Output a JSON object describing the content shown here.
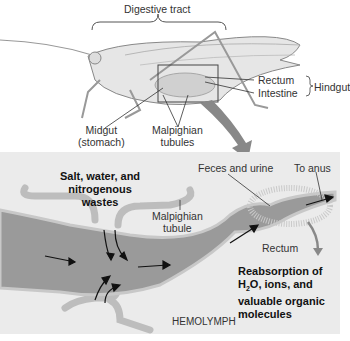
{
  "top_figure": {
    "labels": {
      "digestive_tract": "Digestive tract",
      "rectum": "Rectum",
      "intestine": "Intestine",
      "hindgut": "Hindgut",
      "midgut_line1": "Midgut",
      "midgut_line2": "(stomach)",
      "malpighian_line1": "Malpighian",
      "malpighian_line2": "tubules"
    }
  },
  "detail_figure": {
    "labels": {
      "inputs_line1": "Salt, water, and",
      "inputs_line2": "nitrogenous",
      "inputs_line3": "wastes",
      "tubule_line1": "Malpighian",
      "tubule_line2": "tubule",
      "feces": "Feces and urine",
      "anus": "To anus",
      "rectum": "Rectum",
      "reabs_line1": "Reabsorption of",
      "reabs_line2_pre": "H",
      "reabs_line2_sub": "2",
      "reabs_line2_post": "O, ions, and",
      "reabs_line3": "valuable organic",
      "reabs_line4": "molecules",
      "hemolymph": "HEMOLYMPH"
    }
  },
  "colors": {
    "panel_bg": "#ebebeb",
    "tube": "#8a8a8a",
    "tubule": "#b9b9b9",
    "arrow": "#7a7a7a",
    "text": "#333333"
  }
}
